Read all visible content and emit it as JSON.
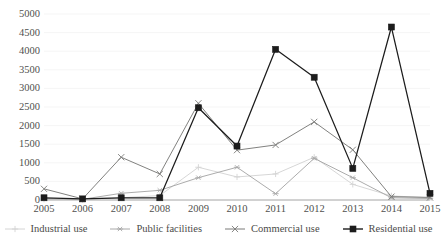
{
  "chart_data": {
    "type": "line",
    "title": "",
    "xlabel": "",
    "ylabel": "",
    "categories": [
      "2005",
      "2006",
      "2007",
      "2008",
      "2009",
      "2010",
      "2011",
      "2012",
      "2013",
      "2014",
      "2015"
    ],
    "ylim": [
      0,
      5000
    ],
    "xlim_labels": [
      "2005",
      "2015"
    ],
    "y_ticks": [
      5000,
      4500,
      4000,
      3500,
      3000,
      2500,
      2000,
      1500,
      1000,
      500,
      0
    ],
    "grid": "horizontal-faint",
    "legend_position": "bottom",
    "series": [
      {
        "name": "Industrial use",
        "color": "#d4d4d4",
        "marker": "plus",
        "values": [
          20,
          10,
          60,
          120,
          880,
          620,
          700,
          1150,
          420,
          110,
          60
        ]
      },
      {
        "name": "Public facilities",
        "color": "#a8a8a8",
        "marker": "asterisk",
        "values": [
          30,
          20,
          180,
          260,
          600,
          880,
          170,
          1120,
          600,
          60,
          40
        ]
      },
      {
        "name": "Commercial use",
        "color": "#7a7a78",
        "marker": "cross",
        "values": [
          300,
          30,
          1150,
          700,
          2600,
          1340,
          1480,
          2100,
          1350,
          90,
          70
        ]
      },
      {
        "name": "Residential use",
        "color": "#1c1c1c",
        "marker": "square",
        "values": [
          60,
          30,
          60,
          60,
          2480,
          1450,
          4050,
          3300,
          850,
          4650,
          180
        ]
      }
    ]
  },
  "legend": {
    "items": [
      {
        "label": "Industrial use"
      },
      {
        "label": "Public facilities"
      },
      {
        "label": "Commercial use"
      },
      {
        "label": "Residential use"
      }
    ]
  }
}
